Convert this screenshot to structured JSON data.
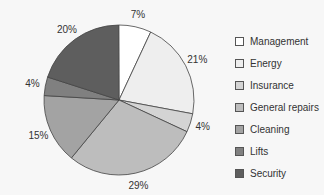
{
  "chart_data": {
    "type": "pie",
    "title": "",
    "categories": [
      "Management",
      "Energy",
      "Insurance",
      "General repairs",
      "Cleaning",
      "Lifts",
      "Security"
    ],
    "values": [
      7,
      21,
      4,
      29,
      15,
      4,
      20
    ],
    "labels": [
      "7%",
      "21%",
      "4%",
      "29%",
      "15%",
      "4%",
      "20%"
    ],
    "colors": [
      "#ffffff",
      "#eeeeee",
      "#d4d4d4",
      "#bdbdbd",
      "#a3a3a3",
      "#808080",
      "#5e5e5e"
    ],
    "start_angle_deg": 25,
    "direction": "clockwise",
    "legend_position": "right"
  },
  "legend": {
    "items": [
      {
        "label": "Management",
        "color": "#ffffff"
      },
      {
        "label": "Energy",
        "color": "#eeeeee"
      },
      {
        "label": "Insurance",
        "color": "#d4d4d4"
      },
      {
        "label": "General repairs",
        "color": "#bdbdbd"
      },
      {
        "label": "Cleaning",
        "color": "#a3a3a3"
      },
      {
        "label": "Lifts",
        "color": "#808080"
      },
      {
        "label": "Security",
        "color": "#5e5e5e"
      }
    ]
  }
}
